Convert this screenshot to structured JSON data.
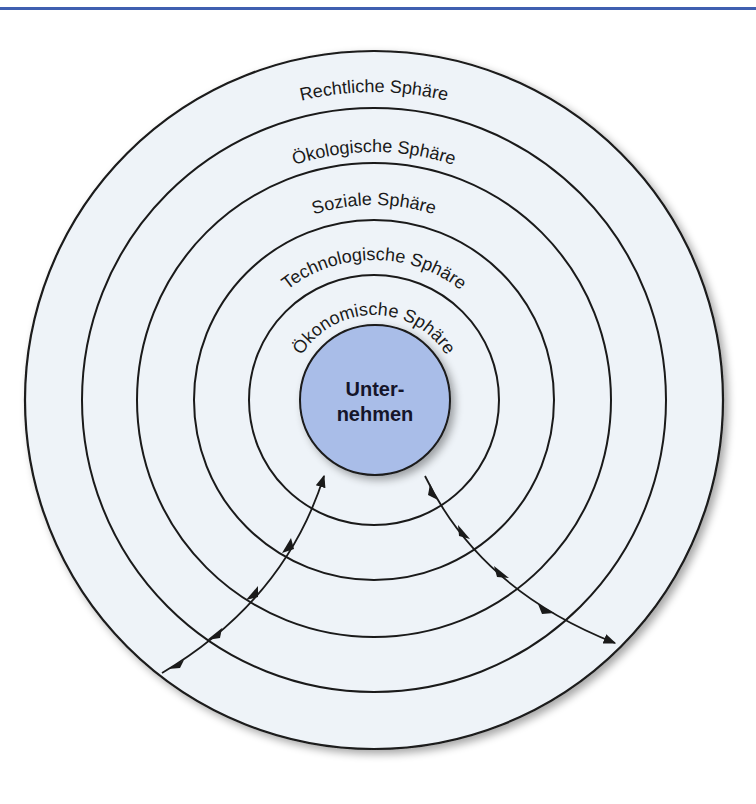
{
  "diagram": {
    "type": "concentric-spheres",
    "center": {
      "label_line1": "Unter-",
      "label_line2": "nehmen",
      "fill": "#a9bde8"
    },
    "spheres": [
      {
        "label": "Rechtliche Sphäre"
      },
      {
        "label": "Ökologische Sphäre"
      },
      {
        "label": "Soziale Sphäre"
      },
      {
        "label": "Technologische Sphäre"
      },
      {
        "label": "Ökonomische Sphäre"
      }
    ],
    "arrows": [
      {
        "direction": "inward",
        "description": "Einwirkung von außen auf das Unternehmen"
      },
      {
        "direction": "outward",
        "description": "Wirkung des Unternehmens nach außen"
      }
    ],
    "colors": {
      "disk_fill": "#eef3f8",
      "line": "#1a1a1a",
      "top_rule": "#3f5fb0"
    }
  }
}
